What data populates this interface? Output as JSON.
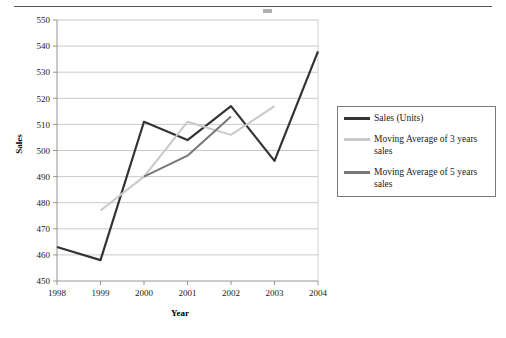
{
  "chart_data": {
    "type": "line",
    "title": "",
    "xlabel": "Year",
    "ylabel": "Sales",
    "categories": [
      "1998",
      "1999",
      "2000",
      "2001",
      "2002",
      "2003",
      "2004"
    ],
    "x": [
      1998,
      1999,
      2000,
      2001,
      2002,
      2003,
      2004
    ],
    "xlim": [
      1998,
      2004
    ],
    "ylim": [
      450,
      550
    ],
    "ytick_step": 10,
    "yticks": [
      450,
      460,
      470,
      480,
      490,
      500,
      510,
      520,
      530,
      540,
      550
    ],
    "grid": "horizontal",
    "legend_position": "right",
    "series": [
      {
        "name": "Sales (Units)",
        "color": "#333333",
        "width": 2.2,
        "x": [
          1998,
          1999,
          2000,
          2001,
          2002,
          2003,
          2004
        ],
        "values": [
          463,
          458,
          511,
          504,
          517,
          496,
          538
        ]
      },
      {
        "name": "Moving Average of 3 years sales",
        "color": "#c9c9c9",
        "width": 2.0,
        "x": [
          1999,
          2000,
          2001,
          2002,
          2003
        ],
        "values": [
          477,
          490,
          511,
          506,
          517
        ]
      },
      {
        "name": "Moving Average of 5 years sales",
        "color": "#777777",
        "width": 2.0,
        "x": [
          2000,
          2001,
          2002
        ],
        "values": [
          490,
          498,
          513
        ]
      }
    ]
  },
  "legend": {
    "items": [
      {
        "label": "Sales (Units)",
        "color": "#333333"
      },
      {
        "label": "Moving Average of 3 years sales",
        "color": "#c9c9c9"
      },
      {
        "label": "Moving Average of 5 years sales",
        "color": "#777777"
      }
    ]
  },
  "axes": {
    "y_title": "Sales",
    "x_title": "Year"
  }
}
